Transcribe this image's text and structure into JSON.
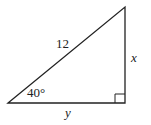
{
  "diagram": {
    "type": "right-triangle",
    "hypotenuse_label": "12",
    "vertical_side_label": "x",
    "horizontal_side_label": "y",
    "angle_label": "40°",
    "right_angle_marker": true,
    "stroke_color": "#222222"
  }
}
